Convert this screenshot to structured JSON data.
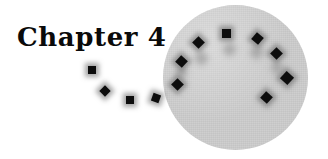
{
  "page": {
    "width": 328,
    "height": 159,
    "background_color": "#ffffff"
  },
  "heading": {
    "text": "Chapter 4",
    "color": "#0a0a0a",
    "x": 17,
    "y": 24,
    "font_size": 26
  },
  "disc": {
    "name": "gray-circle",
    "color": "#cdcdcd",
    "x": 163,
    "y": 5,
    "diameter": 145
  },
  "markers": {
    "color": "#0d0d0d",
    "ghost_color": "#9a9a9a",
    "trail": [
      {
        "x": 88,
        "y": 66,
        "size": 8,
        "rotate": 0,
        "shadow": true
      },
      {
        "x": 101,
        "y": 87,
        "size": 8,
        "rotate": 45,
        "shadow": true
      },
      {
        "x": 126,
        "y": 96,
        "size": 8,
        "rotate": 0,
        "shadow": true
      },
      {
        "x": 152,
        "y": 94,
        "size": 8,
        "rotate": 20,
        "shadow": true
      }
    ],
    "arc": [
      {
        "x": 173,
        "y": 80,
        "size": 9,
        "rotate": 45,
        "shadow": true
      },
      {
        "x": 177,
        "y": 57,
        "size": 9,
        "rotate": 42,
        "shadow": true
      },
      {
        "x": 194,
        "y": 38,
        "size": 9,
        "rotate": 45,
        "shadow": true
      },
      {
        "x": 222,
        "y": 29,
        "size": 9,
        "rotate": 0,
        "shadow": true
      },
      {
        "x": 253,
        "y": 34,
        "size": 9,
        "rotate": 40,
        "shadow": true
      },
      {
        "x": 272,
        "y": 49,
        "size": 9,
        "rotate": 45,
        "shadow": true
      },
      {
        "x": 282,
        "y": 73,
        "size": 10,
        "rotate": 42,
        "shadow": true
      },
      {
        "x": 262,
        "y": 93,
        "size": 9,
        "rotate": 42,
        "shadow": true
      }
    ],
    "ghosts": [
      {
        "x": 196,
        "y": 53,
        "size": 11,
        "rotate": 45
      },
      {
        "x": 224,
        "y": 44,
        "size": 11,
        "rotate": 45
      },
      {
        "x": 251,
        "y": 47,
        "size": 11,
        "rotate": 45
      },
      {
        "x": 272,
        "y": 63,
        "size": 10,
        "rotate": 45
      },
      {
        "x": 176,
        "y": 68,
        "size": 10,
        "rotate": 45
      }
    ]
  }
}
